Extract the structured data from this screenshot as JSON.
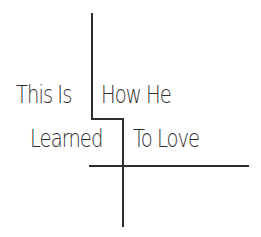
{
  "title": {
    "line1": {
      "left": "This Is",
      "right": "How He"
    },
    "line2": {
      "left": "Learned",
      "right": "To Love"
    }
  },
  "colors": {
    "background": "#ffffff",
    "ink": "#2e2e2e"
  }
}
